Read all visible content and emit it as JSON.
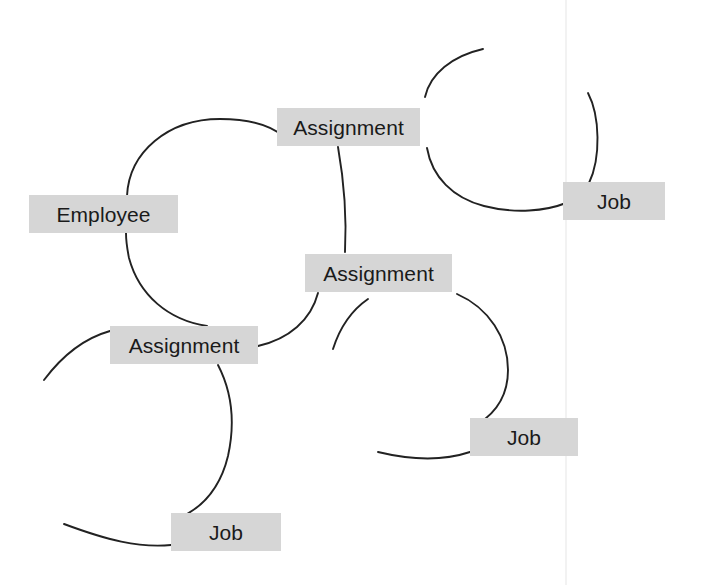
{
  "diagram": {
    "background_color": "#ffffff",
    "node_fill_color": "#d6d6d6",
    "node_text_color": "#1a1a1a",
    "line_color": "#222222",
    "seam_color": "#f2f2f2",
    "nodes": [
      {
        "id": "employee",
        "label": "Employee",
        "x": 29,
        "y": 195,
        "w": 149,
        "h": 38
      },
      {
        "id": "assignment-top",
        "label": "Assignment",
        "x": 277,
        "y": 108,
        "w": 143,
        "h": 38
      },
      {
        "id": "assignment-mid",
        "label": "Assignment",
        "x": 305,
        "y": 254,
        "w": 147,
        "h": 38
      },
      {
        "id": "assignment-left",
        "label": "Assignment",
        "x": 110,
        "y": 326,
        "w": 148,
        "h": 38
      },
      {
        "id": "job-top-right",
        "label": "Job",
        "x": 563,
        "y": 182,
        "w": 102,
        "h": 38
      },
      {
        "id": "job-mid-right",
        "label": "Job",
        "x": 470,
        "y": 418,
        "w": 108,
        "h": 38
      },
      {
        "id": "job-bottom",
        "label": "Job",
        "x": 171,
        "y": 513,
        "w": 110,
        "h": 38
      }
    ],
    "relationship_rings": [
      {
        "id": "ring-main",
        "cx": 237,
        "cy": 230,
        "r": 110,
        "connects": [
          "employee",
          "assignment-top",
          "assignment-mid",
          "assignment-left"
        ]
      },
      {
        "id": "ring-top-right",
        "cx": 505,
        "cy": 128,
        "r": 78,
        "connects": [
          "assignment-top",
          "job-top-right"
        ]
      },
      {
        "id": "ring-mid-right",
        "cx": 455,
        "cy": 370,
        "r": 85,
        "connects": [
          "assignment-mid",
          "job-mid-right"
        ]
      },
      {
        "id": "ring-bottom-left",
        "cx": 150,
        "cy": 440,
        "r": 80,
        "connects": [
          "assignment-left",
          "job-bottom"
        ]
      }
    ],
    "seam": {
      "x": 565
    }
  }
}
